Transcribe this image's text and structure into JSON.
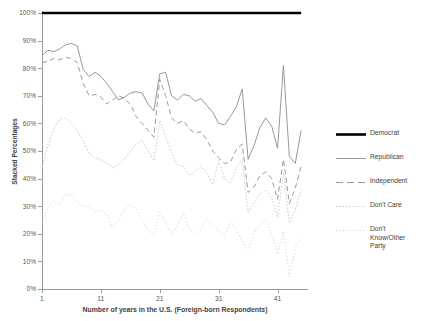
{
  "chart_data": {
    "type": "line",
    "title": "",
    "xlabel": "Number of years in the U.S. (Foreign-born Respondents)",
    "ylabel": "Stacked Percentages",
    "xlim": [
      1,
      46
    ],
    "ylim": [
      0,
      100
    ],
    "xticks": [
      1,
      11,
      21,
      31,
      41
    ],
    "xticklabels": [
      "1",
      "11",
      "21",
      "31",
      "41"
    ],
    "yticks": [
      0,
      10,
      20,
      30,
      40,
      50,
      60,
      70,
      80,
      90,
      100
    ],
    "yticklabels": [
      "0%",
      "10%",
      "20%",
      "30%",
      "40%",
      "50%",
      "60%",
      "70%",
      "80%",
      "90%",
      "100%"
    ],
    "grid": false,
    "legend_position": "right",
    "x": [
      1,
      2,
      3,
      4,
      5,
      6,
      7,
      8,
      9,
      10,
      11,
      12,
      13,
      14,
      15,
      16,
      17,
      18,
      19,
      20,
      21,
      22,
      23,
      24,
      25,
      26,
      27,
      28,
      29,
      30,
      31,
      32,
      33,
      34,
      35,
      36,
      37,
      38,
      39,
      40,
      41,
      42,
      43,
      44,
      45
    ],
    "series": [
      {
        "name": "Democrat",
        "style": "solid-thick",
        "color": "#000000",
        "width": 2.6,
        "values": [
          100,
          100,
          100,
          100,
          100,
          100,
          100,
          100,
          100,
          100,
          100,
          100,
          100,
          100,
          100,
          100,
          100,
          100,
          100,
          100,
          100,
          100,
          100,
          100,
          100,
          100,
          100,
          100,
          100,
          100,
          100,
          100,
          100,
          100,
          100,
          100,
          100,
          100,
          100,
          100,
          100,
          100,
          100,
          100,
          100
        ]
      },
      {
        "name": "Republican",
        "style": "solid-thin",
        "color": "#8c8c8c",
        "width": 0.9,
        "values": [
          84.5,
          86.5,
          86.0,
          87.0,
          88.5,
          89.0,
          88.0,
          79.5,
          77.0,
          78.5,
          77.0,
          74.5,
          71.5,
          68.5,
          69.5,
          71.0,
          71.5,
          71.0,
          67.0,
          64.5,
          78.0,
          78.5,
          70.0,
          68.5,
          70.5,
          70.0,
          68.0,
          69.0,
          66.5,
          64.0,
          60.0,
          59.5,
          62.5,
          66.0,
          72.5,
          47.0,
          52.0,
          58.5,
          62.0,
          59.0,
          51.0,
          81.0,
          48.0,
          45.5,
          57.5
        ]
      },
      {
        "name": "Independent",
        "style": "dashed",
        "color": "#9a9a9a",
        "width": 1.0,
        "values": [
          82.0,
          82.5,
          83.5,
          83.0,
          84.0,
          83.5,
          82.0,
          74.5,
          70.0,
          70.5,
          69.5,
          67.0,
          68.5,
          70.0,
          69.0,
          67.0,
          62.5,
          60.0,
          57.5,
          55.0,
          76.0,
          70.0,
          62.0,
          60.0,
          61.0,
          58.0,
          56.5,
          57.0,
          54.0,
          50.0,
          47.5,
          45.5,
          46.0,
          50.5,
          52.5,
          35.0,
          37.0,
          41.0,
          42.5,
          40.0,
          32.5,
          47.0,
          31.0,
          36.5,
          44.5
        ]
      },
      {
        "name": "Don't Care",
        "style": "dotted",
        "color": "#c9c9c9",
        "width": 1.0,
        "values": [
          44.0,
          52.0,
          58.0,
          61.5,
          62.0,
          60.0,
          57.5,
          53.5,
          49.0,
          47.5,
          47.0,
          45.5,
          44.0,
          45.0,
          47.0,
          50.0,
          52.5,
          54.0,
          50.0,
          46.5,
          61.0,
          55.0,
          49.5,
          45.0,
          44.5,
          41.0,
          43.0,
          44.5,
          42.0,
          38.0,
          46.5,
          40.0,
          38.5,
          44.0,
          47.0,
          28.0,
          31.0,
          34.5,
          36.0,
          33.0,
          26.0,
          42.0,
          24.0,
          28.5,
          36.0
        ]
      },
      {
        "name": "Don't Know/Other Party",
        "style": "dotted-light",
        "color": "#d5d5d5",
        "width": 1.0,
        "values": [
          24.0,
          29.5,
          32.0,
          30.5,
          34.5,
          34.0,
          31.5,
          30.0,
          30.0,
          28.0,
          28.5,
          27.0,
          22.5,
          25.0,
          28.5,
          31.0,
          29.0,
          25.0,
          21.5,
          19.5,
          28.0,
          24.5,
          19.5,
          23.0,
          27.5,
          22.0,
          19.5,
          21.5,
          25.5,
          23.0,
          21.0,
          19.0,
          24.5,
          21.5,
          17.0,
          14.0,
          20.0,
          23.5,
          25.0,
          20.0,
          12.5,
          21.0,
          4.5,
          15.0,
          18.5
        ]
      }
    ]
  },
  "legend": {
    "items": [
      {
        "label": "Democrat"
      },
      {
        "label": "Republican"
      },
      {
        "label": "Independent"
      },
      {
        "label": "Don't Care"
      },
      {
        "label": "Don't Know/Other Party"
      }
    ]
  }
}
